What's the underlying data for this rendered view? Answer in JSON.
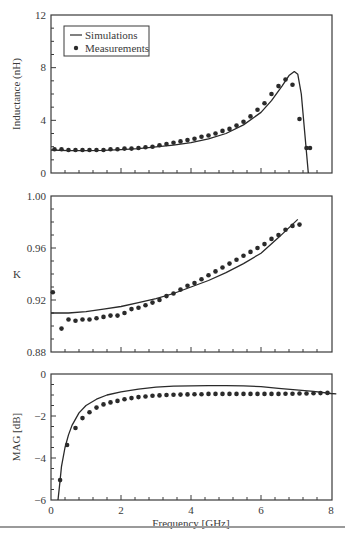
{
  "chart_data": [
    {
      "type": "line",
      "title": "",
      "xlabel": "",
      "ylabel": "Inductance (nH)",
      "xlim": [
        0,
        8
      ],
      "ylim": [
        0,
        12
      ],
      "yticks": [
        0,
        4,
        8,
        12
      ],
      "grid": false,
      "legend": {
        "position": "upper-left",
        "entries": [
          "Simulations",
          "Measurements"
        ]
      },
      "series": [
        {
          "name": "Simulations",
          "style": "line",
          "x": [
            0,
            0.5,
            1,
            1.5,
            2,
            2.5,
            3,
            3.5,
            4,
            4.5,
            5,
            5.5,
            6,
            6.3,
            6.6,
            6.8,
            6.95,
            7.05,
            7.15,
            7.25,
            7.35
          ],
          "y": [
            1.75,
            1.7,
            1.7,
            1.72,
            1.78,
            1.85,
            1.98,
            2.12,
            2.3,
            2.6,
            3.0,
            3.65,
            4.6,
            5.5,
            6.6,
            7.4,
            7.7,
            7.5,
            6.0,
            3.0,
            0.0
          ]
        },
        {
          "name": "Measurements",
          "style": "markers",
          "x": [
            0.1,
            0.3,
            0.5,
            0.7,
            0.9,
            1.1,
            1.3,
            1.5,
            1.7,
            1.9,
            2.1,
            2.3,
            2.5,
            2.7,
            2.9,
            3.1,
            3.3,
            3.5,
            3.7,
            3.9,
            4.1,
            4.3,
            4.5,
            4.7,
            4.9,
            5.1,
            5.3,
            5.5,
            5.7,
            5.9,
            6.1,
            6.3,
            6.5,
            6.7,
            6.9,
            7.1,
            7.3,
            7.4
          ],
          "y": [
            1.8,
            1.8,
            1.75,
            1.75,
            1.75,
            1.75,
            1.75,
            1.75,
            1.8,
            1.8,
            1.85,
            1.85,
            1.9,
            1.95,
            2.0,
            2.1,
            2.2,
            2.3,
            2.4,
            2.5,
            2.6,
            2.75,
            2.85,
            3.0,
            3.2,
            3.35,
            3.6,
            3.9,
            4.3,
            4.8,
            5.3,
            6.0,
            6.6,
            7.1,
            6.7,
            4.1,
            1.9,
            1.9
          ]
        }
      ]
    },
    {
      "type": "line",
      "title": "",
      "xlabel": "",
      "ylabel": "K",
      "xlim": [
        0,
        8
      ],
      "ylim": [
        0.88,
        1.0
      ],
      "yticks": [
        "0.88",
        "0.92",
        "0.96",
        "1.00"
      ],
      "grid": false,
      "series": [
        {
          "name": "Simulations",
          "style": "line",
          "x": [
            0,
            0.5,
            1,
            1.5,
            2,
            2.5,
            3,
            3.5,
            4,
            4.5,
            5,
            5.5,
            6,
            6.5,
            7.05
          ],
          "y": [
            0.91,
            0.91,
            0.911,
            0.913,
            0.915,
            0.918,
            0.921,
            0.925,
            0.93,
            0.935,
            0.941,
            0.948,
            0.956,
            0.968,
            0.982
          ]
        },
        {
          "name": "Measurements",
          "style": "markers",
          "x": [
            0.05,
            0.3,
            0.5,
            0.7,
            0.9,
            1.1,
            1.3,
            1.5,
            1.7,
            1.9,
            2.1,
            2.3,
            2.5,
            2.7,
            2.9,
            3.1,
            3.3,
            3.5,
            3.7,
            3.9,
            4.1,
            4.3,
            4.5,
            4.7,
            4.9,
            5.1,
            5.3,
            5.5,
            5.7,
            5.9,
            6.1,
            6.3,
            6.5,
            6.7,
            6.9,
            7.1
          ],
          "y": [
            0.926,
            0.898,
            0.905,
            0.904,
            0.905,
            0.905,
            0.906,
            0.907,
            0.908,
            0.908,
            0.91,
            0.913,
            0.914,
            0.916,
            0.918,
            0.92,
            0.923,
            0.925,
            0.928,
            0.931,
            0.933,
            0.936,
            0.939,
            0.942,
            0.945,
            0.948,
            0.951,
            0.954,
            0.957,
            0.96,
            0.963,
            0.967,
            0.97,
            0.974,
            0.977,
            0.978
          ]
        }
      ]
    },
    {
      "type": "line",
      "title": "",
      "xlabel": "Frequency [GHz]",
      "ylabel": "MAG [dB]",
      "xlim": [
        0,
        8
      ],
      "ylim": [
        -6,
        0
      ],
      "xticks": [
        0,
        2,
        4,
        6,
        8
      ],
      "yticks": [
        -6,
        -4,
        -2,
        0
      ],
      "grid": false,
      "series": [
        {
          "name": "Simulations",
          "style": "line",
          "x": [
            0.2,
            0.25,
            0.3,
            0.4,
            0.5,
            0.6,
            0.8,
            1.0,
            1.3,
            1.6,
            2.0,
            2.5,
            3.0,
            3.5,
            4.0,
            4.5,
            5.0,
            5.5,
            6.0,
            6.5,
            7.0,
            7.5,
            8.0,
            8.15
          ],
          "y": [
            -6.0,
            -5.2,
            -4.4,
            -3.5,
            -2.9,
            -2.45,
            -1.85,
            -1.5,
            -1.2,
            -1.0,
            -0.85,
            -0.72,
            -0.63,
            -0.58,
            -0.56,
            -0.55,
            -0.55,
            -0.56,
            -0.6,
            -0.68,
            -0.75,
            -0.83,
            -0.93,
            -0.95
          ]
        },
        {
          "name": "Measurements",
          "style": "markers",
          "x": [
            0.26,
            0.46,
            0.7,
            0.9,
            1.1,
            1.3,
            1.5,
            1.7,
            1.9,
            2.1,
            2.3,
            2.5,
            2.7,
            2.9,
            3.1,
            3.3,
            3.5,
            3.7,
            3.9,
            4.1,
            4.3,
            4.5,
            4.7,
            4.9,
            5.1,
            5.3,
            5.5,
            5.7,
            5.9,
            6.1,
            6.3,
            6.5,
            6.7,
            6.9,
            7.1,
            7.3,
            7.5,
            7.7,
            7.9
          ],
          "y": [
            -5.05,
            -3.38,
            -2.57,
            -2.1,
            -1.82,
            -1.6,
            -1.45,
            -1.35,
            -1.28,
            -1.2,
            -1.15,
            -1.1,
            -1.07,
            -1.04,
            -1.02,
            -1.0,
            -0.99,
            -0.98,
            -0.97,
            -0.96,
            -0.96,
            -0.95,
            -0.95,
            -0.95,
            -0.95,
            -0.95,
            -0.95,
            -0.95,
            -0.95,
            -0.95,
            -0.95,
            -0.95,
            -0.94,
            -0.94,
            -0.93,
            -0.93,
            -0.92,
            -0.91,
            -0.9
          ]
        }
      ]
    }
  ],
  "panels": [
    {
      "ylabel": "Inductance (nH)",
      "ytick_labels": [
        "0",
        "4",
        "8",
        "12"
      ]
    },
    {
      "ylabel": "K",
      "ytick_labels": [
        "0.88",
        "0.92",
        "0.96",
        "1.00"
      ]
    },
    {
      "ylabel": "MAG [dB]",
      "ytick_labels": [
        "−6",
        "−4",
        "−2",
        "0"
      ],
      "xtick_labels": [
        "0",
        "2",
        "4",
        "6",
        "8"
      ],
      "xlabel": "Frequency [GHz]"
    }
  ],
  "legend": {
    "simulations": "Simulations",
    "measurements": "Measurements"
  },
  "colors": {
    "line": "#2a2a2a",
    "marker": "#2a2a2a",
    "frame": "#3a3a3a",
    "text": "#3a3a3a"
  }
}
